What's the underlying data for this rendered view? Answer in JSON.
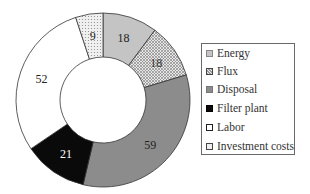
{
  "chart_data": {
    "type": "pie",
    "subtype": "donut",
    "title": "",
    "categories": [
      "Energy",
      "Flux",
      "Disposal",
      "Filter plant",
      "Labor",
      "Investment costs"
    ],
    "values": [
      18,
      18,
      59,
      21,
      52,
      9
    ],
    "data_labels": [
      "18",
      "18",
      "59",
      "21",
      "52",
      "9"
    ],
    "start_angle": "12 o'clock",
    "direction": "clockwise",
    "legend_position": "right",
    "fills": [
      {
        "name": "Energy",
        "color": "#c4c4c4",
        "pattern": "solid-light-gray"
      },
      {
        "name": "Flux",
        "color": "#d9d9d9",
        "pattern": "crosshatch"
      },
      {
        "name": "Disposal",
        "color": "#8c8c8c",
        "pattern": "solid-dark-gray"
      },
      {
        "name": "Filter plant",
        "color": "#0a0a0a",
        "pattern": "solid-black"
      },
      {
        "name": "Labor",
        "color": "#ffffff",
        "pattern": "solid-white"
      },
      {
        "name": "Investment costs",
        "color": "#e8e8e8",
        "pattern": "dotted"
      }
    ]
  },
  "legend": {
    "items": [
      {
        "label": "Energy"
      },
      {
        "label": "Flux"
      },
      {
        "label": "Disposal"
      },
      {
        "label": "Filter plant"
      },
      {
        "label": "Labor"
      },
      {
        "label": "Investment costs"
      }
    ]
  }
}
